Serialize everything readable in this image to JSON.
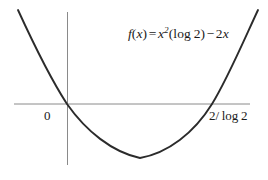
{
  "figure": {
    "title": "",
    "background_color": "#ffffff",
    "width": 268,
    "height": 180
  },
  "equation": {
    "full_text": "f(x) = x²(log 2) − 2x",
    "fn_name": "f",
    "open_paren": "(",
    "arg": "x",
    "close_paren": ")",
    "equals": "=",
    "base": "x",
    "exponent": "2",
    "group_open": "(",
    "log": "log",
    "log_arg": "2",
    "group_close": ")",
    "minus": "−",
    "coefficient": "2",
    "linear_var": "x"
  },
  "labels": {
    "origin": "0",
    "root": "2/ log 2",
    "root_numerator": "2/",
    "root_log": "log",
    "root_log_arg": "2"
  },
  "colors": {
    "curve": "#2b2b2b",
    "axis": "#8a8a8a",
    "text": "#1a1a1a",
    "background": "#ffffff"
  },
  "chart_data": {
    "type": "line",
    "title": "",
    "xlabel": "",
    "ylabel": "",
    "function": "f(x) = x^2(log 2) - 2x",
    "grid": false,
    "legend": null,
    "annotations": [
      {
        "text": "f(x) = x²(log 2) − 2x",
        "x_px": 128,
        "y_px": 36
      },
      {
        "text": "0",
        "x_px": 48,
        "y_px": 116
      },
      {
        "text": "2/ log 2",
        "x_px": 210,
        "y_px": 116
      }
    ],
    "axes": {
      "x_axis_y_px": 104,
      "x_axis_x_start_px": 14,
      "x_axis_x_end_px": 250,
      "y_axis_x_px": 67,
      "y_axis_y_start_px": 12,
      "y_axis_y_end_px": 165
    },
    "roots": [
      {
        "label": "0",
        "x_px": 67,
        "y_px": 104
      },
      {
        "label": "2/ log 2",
        "x_px": 212,
        "y_px": 104
      }
    ],
    "vertex": {
      "x_px": 140,
      "y_px": 158
    },
    "curve_points_px": [
      [
        18,
        10
      ],
      [
        28,
        32
      ],
      [
        38,
        52
      ],
      [
        48,
        69
      ],
      [
        58,
        85
      ],
      [
        67,
        104
      ],
      [
        78,
        117
      ],
      [
        90,
        131
      ],
      [
        102,
        141
      ],
      [
        115,
        150
      ],
      [
        128,
        156
      ],
      [
        140,
        158
      ],
      [
        152,
        157
      ],
      [
        165,
        152
      ],
      [
        178,
        144
      ],
      [
        190,
        133
      ],
      [
        202,
        118
      ],
      [
        212,
        104
      ],
      [
        224,
        82
      ],
      [
        236,
        56
      ],
      [
        248,
        30
      ],
      [
        258,
        10
      ]
    ],
    "curve_path": "M 18,10 C 40,58 54,84 67,104 C 86,131 112,152 140,158 C 168,153 194,133 212,104 C 227,80 244,40 258,10"
  }
}
